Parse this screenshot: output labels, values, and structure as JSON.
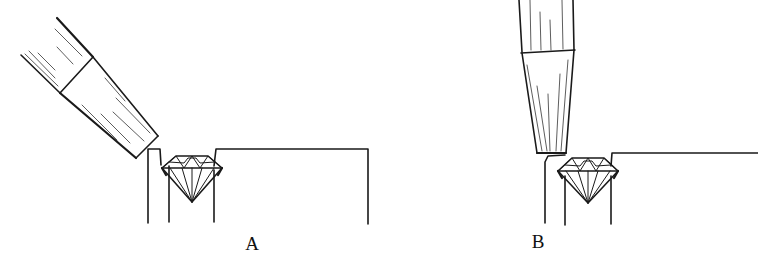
{
  "figure": {
    "panels": [
      {
        "id": "A",
        "label": "A",
        "description": "Pusher tool held at an angle against the bezel wall beside a round brilliant diamond set in the setting"
      },
      {
        "id": "B",
        "label": "B",
        "description": "Pusher tool held vertically pressing the bezel wall down over the girdle of the diamond"
      }
    ],
    "colors": {
      "ink": "#1a1a1a",
      "background": "#ffffff"
    }
  }
}
